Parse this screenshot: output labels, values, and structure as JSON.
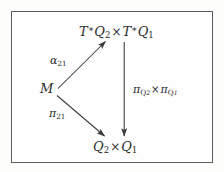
{
  "figure": {
    "type": "commutative-diagram",
    "background_color": "#fdfdfc",
    "frame_color": "#5d5d5d",
    "ink_color": "#2b2b2b"
  },
  "nodes": {
    "top": {
      "name": "cotangent-product",
      "plain": "T*Q2 x T*Q1",
      "parts": {
        "t1": "T",
        "star1": "∗",
        "q1": "Q",
        "sub1": "2",
        "times": "×",
        "t2": "T",
        "star2": "∗",
        "q2": "Q",
        "sub2": "1"
      }
    },
    "left": {
      "name": "manifold-m",
      "plain": "M",
      "parts": {
        "m": "M"
      }
    },
    "bottom": {
      "name": "base-product",
      "plain": "Q2 x Q1",
      "parts": {
        "q1": "Q",
        "sub1": "2",
        "times": "×",
        "q2": "Q",
        "sub2": "1"
      }
    }
  },
  "edges": {
    "alpha": {
      "name": "alpha-21-arrow",
      "plain": "alpha_21",
      "parts": {
        "sym": "α",
        "sub": "21"
      },
      "from": "left",
      "to": "top",
      "direction": "up-right"
    },
    "pi21": {
      "name": "pi-21-arrow",
      "plain": "pi_21",
      "parts": {
        "sym": "π",
        "sub": "21"
      },
      "from": "left",
      "to": "bottom",
      "direction": "down-right"
    },
    "projection": {
      "name": "projection-product-arrow",
      "plain": "pi_Q2 x pi_Q1",
      "parts": {
        "sym1": "π",
        "subq1": "Q",
        "subsub1": "2",
        "times": "×",
        "sym2": "π",
        "subq2": "Q",
        "subsub2": "1"
      },
      "from": "top",
      "to": "bottom",
      "direction": "down"
    }
  }
}
